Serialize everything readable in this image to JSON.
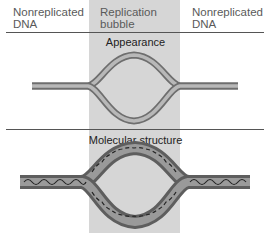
{
  "labels": {
    "left": [
      "Nonreplicated",
      "DNA"
    ],
    "center": [
      "Replication",
      "bubble"
    ],
    "right": [
      "Nonreplicated",
      "DNA"
    ]
  },
  "sections": {
    "appearance": "Appearance",
    "molecular": "Molecular structure"
  },
  "colors": {
    "bubble_shade": "#d6d6d6",
    "strand_light": "#b0b0b0",
    "strand_dark": "#6e6e6e",
    "helix_line": "#222222"
  }
}
